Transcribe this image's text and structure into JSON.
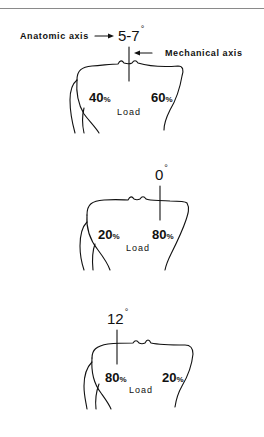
{
  "figure": {
    "panels": [
      {
        "id": "normal",
        "angle_value": "5-7",
        "angle_unit": "°",
        "anatomic_axis_label": "Anatomic axis",
        "mechanical_axis_label": "Mechanical axis",
        "left_load_value": "40",
        "right_load_value": "60",
        "percent_symbol": "%",
        "load_label": "Load"
      },
      {
        "id": "zero-degree",
        "angle_value": "0",
        "angle_unit": "°",
        "left_load_value": "20",
        "right_load_value": "80",
        "percent_symbol": "%",
        "load_label": "Load"
      },
      {
        "id": "twelve-degree",
        "angle_value": "12",
        "angle_unit": "°",
        "left_load_value": "80",
        "right_load_value": "20",
        "percent_symbol": "%",
        "load_label": "Load"
      }
    ],
    "colors": {
      "line": "#111111",
      "rule": "#8a8a8a",
      "background": "#ffffff"
    }
  }
}
